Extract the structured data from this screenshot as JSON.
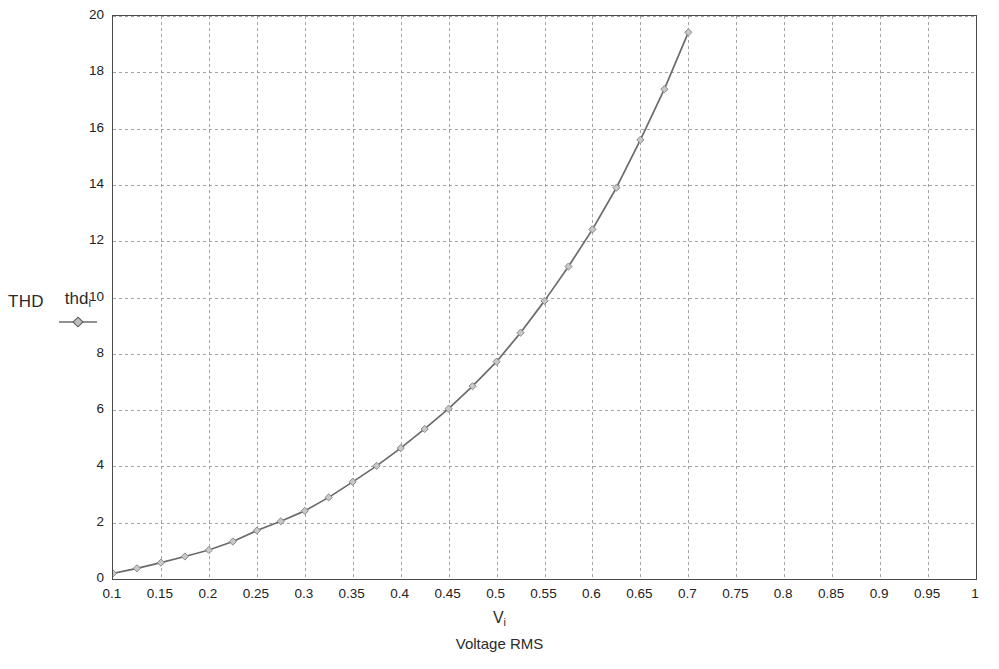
{
  "chart_data": {
    "type": "line",
    "title": "",
    "subtitle": "",
    "ylabel": "THD",
    "xlabel_symbol": "V",
    "xlabel_symbol_sub": "i",
    "xlabel": "Voltage RMS",
    "xlim": [
      0.1,
      1.0
    ],
    "ylim": [
      0,
      20
    ],
    "xticks": [
      "0.1",
      "0.15",
      "0.2",
      "0.25",
      "0.3",
      "0.35",
      "0.4",
      "0.45",
      "0.5",
      "0.55",
      "0.6",
      "0.65",
      "0.7",
      "0.75",
      "0.8",
      "0.85",
      "0.9",
      "0.95",
      "1"
    ],
    "xtick_values": [
      0.1,
      0.15,
      0.2,
      0.25,
      0.3,
      0.35,
      0.4,
      0.45,
      0.5,
      0.55,
      0.6,
      0.65,
      0.7,
      0.75,
      0.8,
      0.85,
      0.9,
      0.95,
      1.0
    ],
    "yticks": [
      "0",
      "2",
      "4",
      "6",
      "8",
      "10",
      "12",
      "14",
      "16",
      "18",
      "20"
    ],
    "ytick_values": [
      0,
      2,
      4,
      6,
      8,
      10,
      12,
      14,
      16,
      18,
      20
    ],
    "grid": true,
    "grid_style": "dashed",
    "grid_color": "#9a9a9a",
    "frame_color": "#4a4a4a",
    "line_color": "#6b6b6b",
    "marker": "diamond",
    "marker_color": "#8a8a8a",
    "legend_position": "left-outside",
    "series": [
      {
        "name": "thd",
        "name_sub": "i",
        "x": [
          0.1,
          0.125,
          0.15,
          0.175,
          0.2,
          0.225,
          0.25,
          0.275,
          0.3,
          0.325,
          0.35,
          0.375,
          0.4,
          0.425,
          0.45,
          0.475,
          0.5,
          0.525,
          0.55,
          0.575,
          0.6,
          0.625,
          0.65,
          0.675,
          0.7
        ],
        "values": [
          0.2,
          0.38,
          0.58,
          0.8,
          1.03,
          1.33,
          1.72,
          2.05,
          2.42,
          2.9,
          3.45,
          4.02,
          4.65,
          5.33,
          6.05,
          6.85,
          7.72,
          8.75,
          9.88,
          11.1,
          12.42,
          13.9,
          15.6,
          17.4,
          19.42
        ]
      }
    ]
  },
  "legend": {
    "axis_label": "THD"
  }
}
